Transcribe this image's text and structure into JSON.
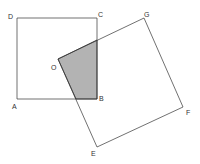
{
  "diagram": {
    "colors": {
      "line": "#333333",
      "shade": "#b3b3b3",
      "background": "#ffffff"
    },
    "square1": {
      "name": "ABCD",
      "vertices": {
        "A": [
          17,
          99
        ],
        "B": [
          97,
          99
        ],
        "C": [
          97,
          18
        ],
        "D": [
          17,
          18
        ]
      }
    },
    "square2": {
      "name": "OEFG",
      "vertices": {
        "O": [
          58,
          59
        ],
        "E": [
          97,
          147
        ],
        "F": [
          183,
          107
        ],
        "G": [
          144,
          18
        ]
      }
    },
    "shaded_region": {
      "points": [
        [
          58,
          59
        ],
        [
          97,
          40
        ],
        [
          97,
          99
        ],
        [
          76,
          99
        ]
      ]
    },
    "labels": {
      "A": "A",
      "B": "B",
      "C": "C",
      "D": "D",
      "O": "O",
      "E": "E",
      "F": "F",
      "G": "G"
    }
  }
}
